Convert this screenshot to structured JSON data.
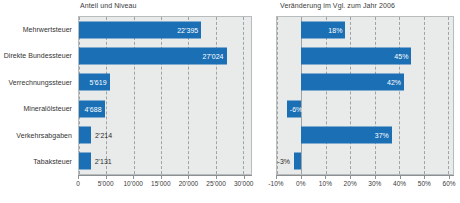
{
  "chart_data": [
    {
      "type": "bar",
      "orientation": "horizontal",
      "panel": "left",
      "title": "Anteil und Niveau",
      "xlabel": "",
      "ylabel": "",
      "categories": [
        "Mehrwertsteuer",
        "Direkte Bundessteuer",
        "Verrechnungssteuer",
        "Mineralölsteuer",
        "Verkehrsabgaben",
        "Tabaksteuer"
      ],
      "values": [
        22395,
        27024,
        5619,
        4688,
        2214,
        2131
      ],
      "value_labels": [
        "22'395",
        "27'024",
        "5'619",
        "4'688",
        "2'214",
        "2'131"
      ],
      "label_placement": [
        "inside",
        "inside",
        "inside",
        "inside",
        "outside",
        "outside"
      ],
      "xlim": [
        0,
        31500
      ],
      "xticks": [
        0,
        5000,
        10000,
        15000,
        20000,
        25000,
        30000
      ],
      "xtick_labels": [
        "0",
        "5'000",
        "10'000",
        "15'000",
        "20'000",
        "25'000",
        "30'000"
      ],
      "grid": "dashed-vertical",
      "legend": "none",
      "bar_color": "#1a6fb5",
      "plot_background": "#e9ebeb"
    },
    {
      "type": "bar",
      "orientation": "horizontal",
      "panel": "right",
      "title": "Veränderung im Vgl. zum Jahr 2006",
      "xlabel": "",
      "ylabel": "",
      "categories": [
        "Mehrwertsteuer",
        "Direkte Bundessteuer",
        "Verrechnungssteuer",
        "Mineralölsteuer",
        "Verkehrsabgaben",
        "Tabaksteuer"
      ],
      "values": [
        18,
        45,
        42,
        -6,
        37,
        -3
      ],
      "value_labels": [
        "18%",
        "45%",
        "42%",
        "-6%",
        "37%",
        "-3%"
      ],
      "label_placement": [
        "inside",
        "inside",
        "inside",
        "inside",
        "inside",
        "outside"
      ],
      "xlim": [
        -10,
        62
      ],
      "xticks": [
        -10,
        0,
        10,
        20,
        30,
        40,
        50,
        60
      ],
      "xtick_labels": [
        "-10%",
        "0%",
        "10%",
        "20%",
        "30%",
        "40%",
        "50%",
        "60%"
      ],
      "grid": "dashed-vertical",
      "zero_line": 0,
      "legend": "none",
      "bar_color": "#1a6fb5",
      "plot_background": "#e9ebeb"
    }
  ]
}
